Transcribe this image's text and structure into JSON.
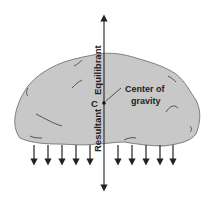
{
  "diagram": {
    "labels": {
      "equilibrant": "Equilibrant",
      "resultant": "Resultant",
      "c_point": "C",
      "center_line1": "Center of",
      "center_line2": "gravity"
    },
    "colors": {
      "rock_fill": "#c8c8c8",
      "rock_stroke": "#555555",
      "line": "#333333",
      "background": "#ffffff"
    },
    "downward_arrows_left_x": [
      34,
      48,
      62,
      76,
      90
    ],
    "downward_arrows_right_x": [
      118,
      132,
      146,
      160,
      173
    ],
    "axis": {
      "x": 104,
      "top": 14,
      "bottom": 192
    },
    "center_point": {
      "x": 104,
      "y": 103
    }
  }
}
